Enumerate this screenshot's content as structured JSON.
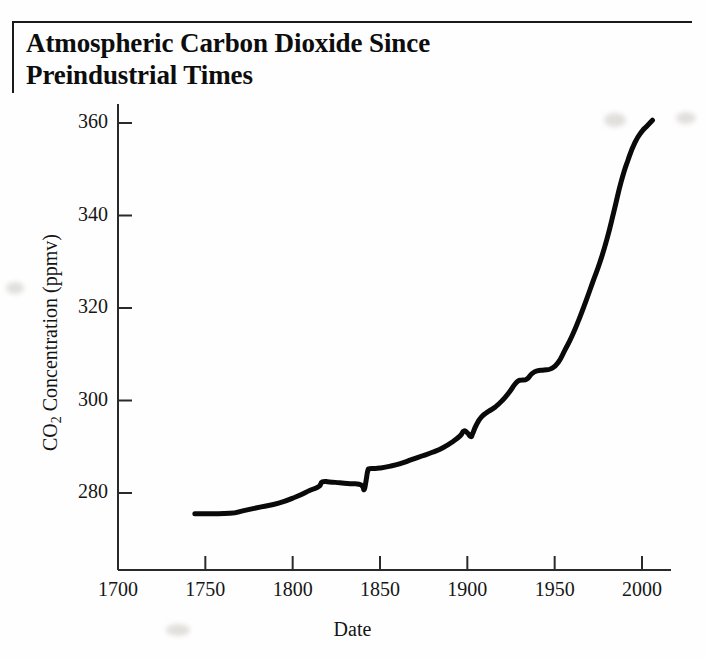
{
  "document": {
    "title": "Atmospheric Carbon Dioxide Since Preindustrial Times",
    "title_line_1": "Atmospheric Carbon Dioxide Since",
    "title_line_2": "Preindustrial Times"
  },
  "chart_data": {
    "type": "line",
    "title": "Atmospheric Carbon Dioxide Since Preindustrial Times",
    "subtitle": "",
    "xlabel": "Date",
    "ylabel": "CO2 Concentration (ppmv)",
    "ylabel_rich": {
      "prefix": "CO",
      "subscript": "2",
      "suffix": " Concentration (ppmv)"
    },
    "xlim": [
      1700,
      2015
    ],
    "ylim": [
      271,
      364
    ],
    "xticks": [
      1700,
      1750,
      1800,
      1850,
      1900,
      1950,
      2000
    ],
    "xtick_labels": [
      "1700",
      "1750",
      "1800",
      "1850",
      "1900",
      "1950",
      "2000"
    ],
    "yticks": [
      280,
      300,
      320,
      340,
      360
    ],
    "ytick_labels": [
      "280",
      "300",
      "320",
      "340",
      "360"
    ],
    "grid": false,
    "legend": null,
    "line_color": "#0a0a0a",
    "line_width": 5,
    "series": [
      {
        "name": "CO2 concentration",
        "units": "ppmv",
        "x": [
          1744,
          1752,
          1764,
          1772,
          1782,
          1792,
          1802,
          1810,
          1815,
          1817,
          1821,
          1827,
          1833,
          1838,
          1840,
          1841,
          1842,
          1843,
          1844,
          1846,
          1850,
          1856,
          1862,
          1868,
          1874,
          1880,
          1886,
          1892,
          1896,
          1898,
          1900,
          1902,
          1903,
          1905,
          1908,
          1912,
          1916,
          1920,
          1924,
          1927,
          1929,
          1931,
          1934,
          1937,
          1940,
          1944,
          1948,
          1952,
          1956,
          1960,
          1964,
          1968,
          1972,
          1976,
          1980,
          1984,
          1988,
          1992,
          1996,
          2000,
          2003,
          2006
        ],
        "y": [
          275.5,
          275.5,
          275.6,
          276.2,
          277.0,
          277.8,
          279.2,
          280.6,
          281.4,
          282.4,
          282.4,
          282.2,
          282.0,
          281.9,
          281.4,
          280.8,
          282.6,
          284.8,
          285.2,
          285.3,
          285.4,
          285.8,
          286.4,
          287.2,
          288.0,
          288.8,
          289.8,
          291.2,
          292.4,
          293.4,
          293.0,
          292.2,
          292.8,
          294.6,
          296.4,
          297.6,
          298.6,
          300.0,
          301.8,
          303.4,
          304.2,
          304.4,
          304.6,
          305.8,
          306.4,
          306.6,
          306.9,
          308.2,
          311.0,
          314.0,
          317.6,
          321.6,
          325.8,
          330.0,
          335.0,
          341.0,
          347.2,
          352.0,
          355.8,
          358.2,
          359.4,
          360.6
        ]
      }
    ],
    "annotations": []
  }
}
